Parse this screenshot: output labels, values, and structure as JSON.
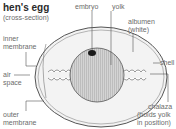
{
  "diagram": {
    "title": "hen's egg",
    "subtitle": "(cross-section)",
    "labels": {
      "embryo": "embryo",
      "yolk": "yolk",
      "albumen_1": "albumen",
      "albumen_2": "(white)",
      "shell": "shell",
      "inner_membrane_1": "inner",
      "inner_membrane_2": "membrane",
      "air_space_1": "air",
      "air_space_2": "space",
      "outer_membrane_1": "outer",
      "outer_membrane_2": "membrane",
      "chalaza_1": "chalaza",
      "chalaza_2": "(holds yolk",
      "chalaza_3": "in position)"
    },
    "colors": {
      "line": "#555555",
      "yolk": "#c8c8c8",
      "albumen": "#f1f1f1",
      "embryo": "#1a1a1a"
    }
  }
}
